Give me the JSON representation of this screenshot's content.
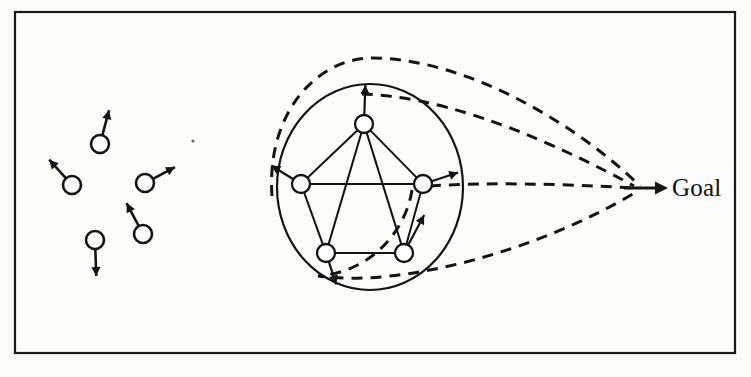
{
  "figure": {
    "width": 751,
    "height": 377,
    "background_color": "#fbfbfa",
    "ink_color": "#141414"
  },
  "frame": {
    "name": "outer-border",
    "x": 15,
    "y": 12,
    "width": 720,
    "height": 341,
    "stroke_color": "#1a1a1a"
  },
  "goal": {
    "label": "Goal",
    "label_x": 672,
    "label_y": 174,
    "arrow_tail_x": 624,
    "arrow_tail_y": 188,
    "arrow_tip_x": 668,
    "arrow_tip_y": 188
  },
  "scattered_agents": [
    {
      "id": "agent-1",
      "cx": 100,
      "cy": 144,
      "r": 9,
      "heading_deg": -75,
      "stem_len": 26
    },
    {
      "id": "agent-2",
      "cx": 72,
      "cy": 185,
      "r": 9,
      "heading_deg": -132,
      "stem_len": 25
    },
    {
      "id": "agent-3",
      "cx": 145,
      "cy": 183,
      "r": 9,
      "heading_deg": -28,
      "stem_len": 25
    },
    {
      "id": "agent-4",
      "cx": 143,
      "cy": 234,
      "r": 9,
      "heading_deg": -118,
      "stem_len": 26
    },
    {
      "id": "agent-5",
      "cx": 95,
      "cy": 240,
      "r": 9,
      "heading_deg": 88,
      "stem_len": 27
    }
  ],
  "formation": {
    "enclosure": {
      "name": "formation-boundary-circle",
      "cx": 370,
      "cy": 187,
      "rx": 93,
      "ry": 103
    },
    "nodes": [
      {
        "id": "node-top",
        "cx": 364,
        "cy": 124,
        "r": 9,
        "heading_deg": -88,
        "stem_len": 30
      },
      {
        "id": "node-left",
        "cx": 301,
        "cy": 184,
        "r": 9,
        "heading_deg": -148,
        "stem_len": 26
      },
      {
        "id": "node-right",
        "cx": 423,
        "cy": 184,
        "r": 9,
        "heading_deg": -18,
        "stem_len": 28
      },
      {
        "id": "node-bottom-left",
        "cx": 326,
        "cy": 253,
        "r": 9,
        "heading_deg": 72,
        "stem_len": 24
      },
      {
        "id": "node-bottom-right",
        "cx": 404,
        "cy": 253,
        "r": 9,
        "heading_deg": -62,
        "stem_len": 34
      }
    ],
    "edges": [
      {
        "from": "node-top",
        "to": "node-left"
      },
      {
        "from": "node-top",
        "to": "node-right"
      },
      {
        "from": "node-left",
        "to": "node-right"
      },
      {
        "from": "node-left",
        "to": "node-bottom-left"
      },
      {
        "from": "node-right",
        "to": "node-bottom-right"
      },
      {
        "from": "node-bottom-left",
        "to": "node-bottom-right"
      },
      {
        "from": "node-top",
        "to": "node-bottom-left"
      },
      {
        "from": "node-top",
        "to": "node-bottom-right"
      }
    ]
  },
  "trajectories": [
    {
      "id": "traj-outer-upper",
      "path": "M 272 196 C 266 112 318 58 372 58 C 460 58 570 118 640 186"
    },
    {
      "id": "traj-inner-upper",
      "path": "M 362 94 C 430 96 520 124 634 186"
    },
    {
      "id": "traj-middle",
      "path": "M 430 186 C 490 182 560 184 634 188"
    },
    {
      "id": "traj-lower",
      "path": "M 412 190 C 406 230 372 272 318 276 C 402 288 540 250 636 192"
    }
  ],
  "specks": [
    {
      "cx": 193,
      "cy": 141,
      "r": 1.6
    }
  ]
}
